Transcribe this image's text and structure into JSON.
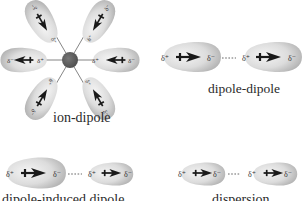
{
  "diagram": {
    "colors": {
      "background": "#ffffff",
      "dipole_fill_light": "#f2f2f2",
      "dipole_fill_dark": "#b8b8b8",
      "arrow": "#1a1a1a",
      "ion": "#5a5a5a",
      "dash": "#555555",
      "text": "#2a2a2a"
    },
    "symbols": {
      "delta_plus": "δ⁺",
      "delta_minus": "δ⁻"
    },
    "panels": [
      {
        "id": "ion-dipole",
        "label": "ion-dipole",
        "description": "Central ion surrounded by six dipoles oriented radially",
        "ion_count": 1,
        "dipole_count": 6
      },
      {
        "id": "dipole-dipole",
        "label": "dipole-dipole",
        "description": "Two permanent dipoles aligned head-to-tail",
        "dipole_count": 2
      },
      {
        "id": "dipole-induced-dipole",
        "label": "dipole-induced dipole",
        "description": "Permanent dipole next to a smaller induced dipole",
        "dipole_count": 2,
        "label_clipped": true
      },
      {
        "id": "induced-dipole-induced-dipole",
        "label": "dispersion",
        "description": "Two induced dipoles aligned head-to-tail",
        "dipole_count": 2,
        "label_clipped": true
      }
    ]
  }
}
